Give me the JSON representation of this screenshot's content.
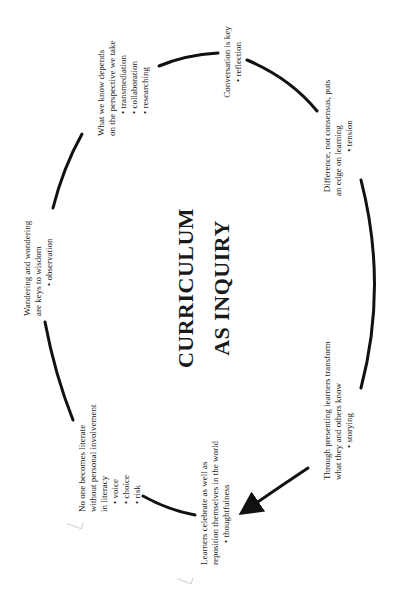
{
  "diagram": {
    "title_line1": "CURRICULUM",
    "title_line2": "AS INQUIRY",
    "nodes": [
      {
        "id": "perspective",
        "lines": [
          "What we know depends",
          "on the perspective we take"
        ],
        "bullets": [
          "transmediation",
          "collaboration",
          "researching"
        ]
      },
      {
        "id": "conversation",
        "lines": [
          "Conversation is key"
        ],
        "bullets": [
          "reflection"
        ]
      },
      {
        "id": "difference",
        "lines": [
          "Difference, not consensus, puts",
          "an edge on learning"
        ],
        "bullets": [
          "tension"
        ]
      },
      {
        "id": "presenting",
        "lines": [
          "Through presenting learners transform",
          "what they and others know"
        ],
        "bullets": [
          "storying"
        ]
      },
      {
        "id": "celebrate",
        "lines": [
          "Learners celebrate as well as",
          "reposition themselves in the world"
        ],
        "bullets": [
          "thoughtfulness"
        ]
      },
      {
        "id": "literate",
        "lines": [
          "No one becomes literate",
          "without personal involvement",
          "in literacy"
        ],
        "bullets": [
          "voice",
          "choice",
          "risk"
        ]
      },
      {
        "id": "wandering",
        "lines": [
          "Wandering and wondering",
          "are keys to wisdom"
        ],
        "bullets": [
          "observation"
        ]
      }
    ],
    "colors": {
      "ink": "#111111",
      "background": "#ffffff"
    }
  }
}
